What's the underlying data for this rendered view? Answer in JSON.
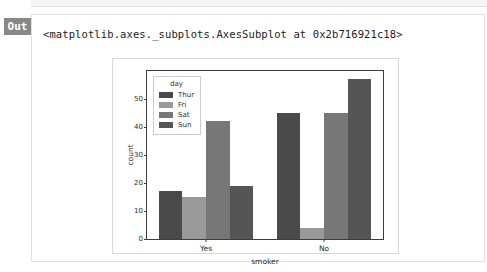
{
  "notebook": {
    "out_label": "Out",
    "repr_text": "<matplotlib.axes._subplots.AxesSubplot at 0x2b716921c18>"
  },
  "chart_data": {
    "type": "bar",
    "title": "",
    "xlabel": "smoker",
    "ylabel": "count",
    "categories": [
      "Yes",
      "No"
    ],
    "legend_title": "day",
    "legend_position": "upper left",
    "grid": false,
    "ylim": [
      0,
      60
    ],
    "yticks": [
      0,
      10,
      20,
      30,
      40,
      50
    ],
    "ytick_labels": [
      "0",
      "10",
      "20",
      "30",
      "40",
      "50"
    ],
    "series": [
      {
        "name": "Thur",
        "color": "#4a4a4a",
        "values": [
          17,
          45
        ]
      },
      {
        "name": "Fri",
        "color": "#9a9a9a",
        "values": [
          15,
          4
        ]
      },
      {
        "name": "Sat",
        "color": "#777777",
        "values": [
          42,
          45
        ]
      },
      {
        "name": "Sun",
        "color": "#555555",
        "values": [
          19,
          57
        ]
      }
    ]
  }
}
